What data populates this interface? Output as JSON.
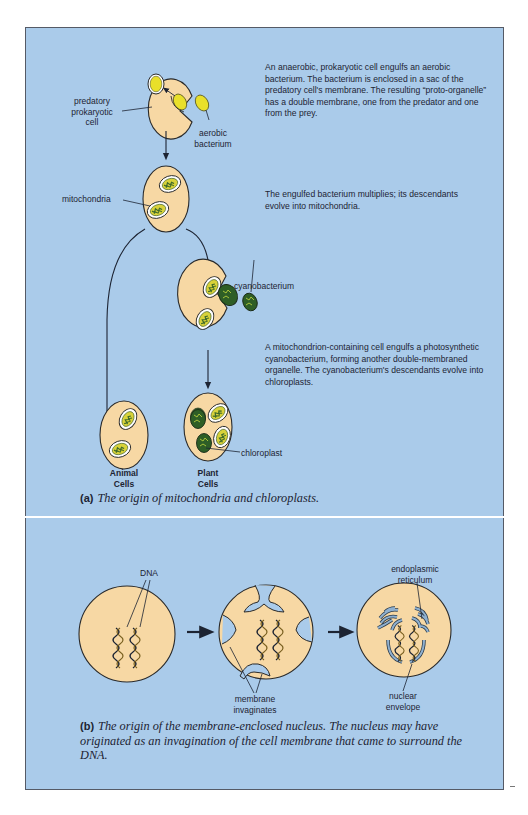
{
  "colors": {
    "panel_bg": "#aacbea",
    "cell_fill": "#f7d8a4",
    "bacterium_yellow": "#e9e02a",
    "cyanobacterium_green": "#2f6b2a",
    "er_blue": "#7fa3c4",
    "outline": "#2a2a2a"
  },
  "part_a": {
    "labels": {
      "predatory_cell": "predatory\nprokaryotic\ncell",
      "aerobic_bacterium": "aerobic\nbacterium",
      "mitochondria": "mitochondria",
      "cyanobacterium": "cyanobacterium",
      "chloroplast": "chloroplast",
      "animal_cells": "Animal\nCells",
      "plant_cells": "Plant\nCells"
    },
    "descriptions": {
      "step1": "An anaerobic, prokaryotic cell engulfs an aerobic bacterium.  The bacterium is enclosed in a sac of the predatory cell's membrane.  The resulting “proto-organelle” has a double membrane, one from the predator and one from the prey.",
      "step2": "The engulfed bacterium multiplies; its descendants evolve into mitochondria.",
      "step3": "A mitochondrion-containing cell engulfs a photosynthetic cyanobacterium, forming another double-membraned organelle.  The cyanobacterium's descendants evolve into chloroplasts."
    },
    "caption": {
      "tag": "(a)",
      "text": "The origin of mitochondria and chloroplasts."
    }
  },
  "part_b": {
    "labels": {
      "dna": "DNA",
      "membrane_invaginates": "membrane\ninvaginates",
      "endoplasmic_reticulum": "endoplasmic\nreticulum",
      "nuclear_envelope": "nuclear\nenvelope"
    },
    "caption": {
      "tag": "(b)",
      "text": "The origin of the membrane-enclosed nucleus. The nucleus may have originated as an invagination of the cell membrane that came to surround the DNA."
    }
  }
}
